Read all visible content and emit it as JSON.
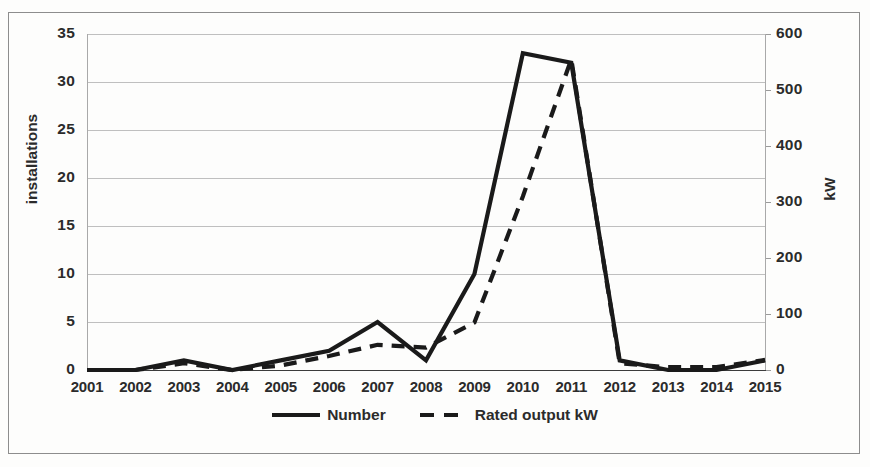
{
  "chart_data": {
    "type": "line",
    "title": "",
    "xlabel": "",
    "ylabel": "installations",
    "y2label": "kW",
    "grid": true,
    "legend_position": "bottom",
    "categories": [
      "2001",
      "2002",
      "2003",
      "2004",
      "2005",
      "2006",
      "2007",
      "2008",
      "2009",
      "2010",
      "2011",
      "2012",
      "2013",
      "2014",
      "2015"
    ],
    "ylim": [
      0,
      35
    ],
    "yticks": [
      "0",
      "5",
      "10",
      "15",
      "20",
      "25",
      "30",
      "35"
    ],
    "y2lim": [
      0,
      600
    ],
    "y2ticks": [
      "0",
      "100",
      "200",
      "300",
      "400",
      "500",
      "600"
    ],
    "series": [
      {
        "name": "Number",
        "axis": "left",
        "style": "solid",
        "color": "#1a1a1a",
        "values": [
          0,
          0,
          1,
          0,
          1,
          2,
          5,
          1,
          10,
          33,
          32,
          1,
          0,
          0,
          1
        ]
      },
      {
        "name": "Rated output kW",
        "axis": "right",
        "style": "dashed",
        "color": "#1a1a1a",
        "values": [
          0,
          0,
          12,
          0,
          8,
          25,
          45,
          40,
          85,
          310,
          555,
          12,
          5,
          5,
          18
        ]
      }
    ]
  },
  "axes": {
    "left": {
      "title": "installations",
      "ticks": [
        "35",
        "30",
        "25",
        "20",
        "15",
        "10",
        "5",
        "0"
      ]
    },
    "right": {
      "title": "kW",
      "ticks": [
        "600",
        "500",
        "400",
        "300",
        "200",
        "100",
        "0"
      ]
    },
    "bottom": {
      "ticks": [
        "2001",
        "2002",
        "2003",
        "2004",
        "2005",
        "2006",
        "2007",
        "2008",
        "2009",
        "2010",
        "2011",
        "2012",
        "2013",
        "2014",
        "2015"
      ]
    }
  },
  "legend": {
    "items": [
      {
        "label": "Number",
        "style": "solid"
      },
      {
        "label": "Rated output kW",
        "style": "dashed"
      }
    ]
  },
  "colors": {
    "series": "#1a1a1a",
    "grid": "#bfbfbf",
    "axis": "#a9a9a9",
    "frame": "#8d8d8d",
    "text": "#2b2b2b",
    "background": "#fdfdfc"
  }
}
